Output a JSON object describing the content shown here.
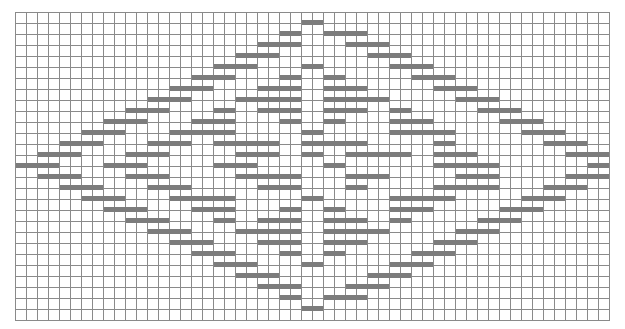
{
  "chart": {
    "type": "weaving-draft-grid",
    "columns": 54,
    "rows": 28,
    "cell_px": 11,
    "bar_color": "#7c7c7c",
    "grid_color": "#8a8a8a",
    "bars": [
      [
        0,
        26,
        2
      ],
      [
        1,
        24,
        2
      ],
      [
        1,
        28,
        4
      ],
      [
        2,
        22,
        4
      ],
      [
        2,
        30,
        4
      ],
      [
        3,
        20,
        4
      ],
      [
        3,
        32,
        4
      ],
      [
        4,
        18,
        4
      ],
      [
        4,
        26,
        2
      ],
      [
        4,
        34,
        4
      ],
      [
        5,
        16,
        4
      ],
      [
        5,
        24,
        2
      ],
      [
        5,
        28,
        2
      ],
      [
        5,
        36,
        4
      ],
      [
        6,
        14,
        4
      ],
      [
        6,
        22,
        4
      ],
      [
        6,
        28,
        4
      ],
      [
        6,
        38,
        4
      ],
      [
        7,
        12,
        4
      ],
      [
        7,
        20,
        6
      ],
      [
        7,
        28,
        6
      ],
      [
        7,
        40,
        4
      ],
      [
        8,
        10,
        4
      ],
      [
        8,
        18,
        2
      ],
      [
        8,
        22,
        4
      ],
      [
        8,
        28,
        4
      ],
      [
        8,
        34,
        2
      ],
      [
        8,
        42,
        4
      ],
      [
        9,
        8,
        4
      ],
      [
        9,
        16,
        4
      ],
      [
        9,
        24,
        2
      ],
      [
        9,
        28,
        2
      ],
      [
        9,
        34,
        4
      ],
      [
        9,
        44,
        4
      ],
      [
        10,
        6,
        4
      ],
      [
        10,
        14,
        6
      ],
      [
        10,
        26,
        2
      ],
      [
        10,
        34,
        6
      ],
      [
        10,
        46,
        4
      ],
      [
        11,
        4,
        4
      ],
      [
        11,
        12,
        4
      ],
      [
        11,
        18,
        6
      ],
      [
        11,
        26,
        6
      ],
      [
        11,
        38,
        2
      ],
      [
        11,
        48,
        4
      ],
      [
        12,
        2,
        4
      ],
      [
        12,
        10,
        4
      ],
      [
        12,
        20,
        4
      ],
      [
        12,
        26,
        2
      ],
      [
        12,
        30,
        6
      ],
      [
        12,
        38,
        4
      ],
      [
        12,
        50,
        4
      ],
      [
        13,
        0,
        4
      ],
      [
        13,
        8,
        4
      ],
      [
        13,
        18,
        4
      ],
      [
        13,
        28,
        2
      ],
      [
        13,
        38,
        6
      ],
      [
        13,
        52,
        2
      ],
      [
        14,
        2,
        4
      ],
      [
        14,
        10,
        4
      ],
      [
        14,
        20,
        6
      ],
      [
        14,
        30,
        4
      ],
      [
        14,
        40,
        4
      ],
      [
        14,
        50,
        4
      ],
      [
        15,
        4,
        4
      ],
      [
        15,
        12,
        4
      ],
      [
        15,
        22,
        4
      ],
      [
        15,
        30,
        2
      ],
      [
        15,
        38,
        6
      ],
      [
        15,
        48,
        4
      ],
      [
        16,
        6,
        4
      ],
      [
        16,
        14,
        6
      ],
      [
        16,
        26,
        2
      ],
      [
        16,
        34,
        6
      ],
      [
        16,
        46,
        4
      ],
      [
        17,
        8,
        4
      ],
      [
        17,
        16,
        4
      ],
      [
        17,
        24,
        2
      ],
      [
        17,
        28,
        2
      ],
      [
        17,
        34,
        4
      ],
      [
        17,
        44,
        4
      ],
      [
        18,
        10,
        4
      ],
      [
        18,
        18,
        2
      ],
      [
        18,
        22,
        4
      ],
      [
        18,
        28,
        4
      ],
      [
        18,
        34,
        2
      ],
      [
        18,
        42,
        4
      ],
      [
        19,
        12,
        4
      ],
      [
        19,
        20,
        6
      ],
      [
        19,
        28,
        6
      ],
      [
        19,
        40,
        4
      ],
      [
        20,
        14,
        4
      ],
      [
        20,
        22,
        4
      ],
      [
        20,
        28,
        4
      ],
      [
        20,
        38,
        4
      ],
      [
        21,
        16,
        4
      ],
      [
        21,
        24,
        2
      ],
      [
        21,
        28,
        2
      ],
      [
        21,
        36,
        4
      ],
      [
        22,
        18,
        4
      ],
      [
        22,
        26,
        2
      ],
      [
        22,
        34,
        4
      ],
      [
        23,
        20,
        4
      ],
      [
        23,
        32,
        4
      ],
      [
        24,
        22,
        4
      ],
      [
        24,
        30,
        4
      ],
      [
        25,
        24,
        2
      ],
      [
        25,
        28,
        4
      ],
      [
        26,
        26,
        2
      ]
    ]
  }
}
